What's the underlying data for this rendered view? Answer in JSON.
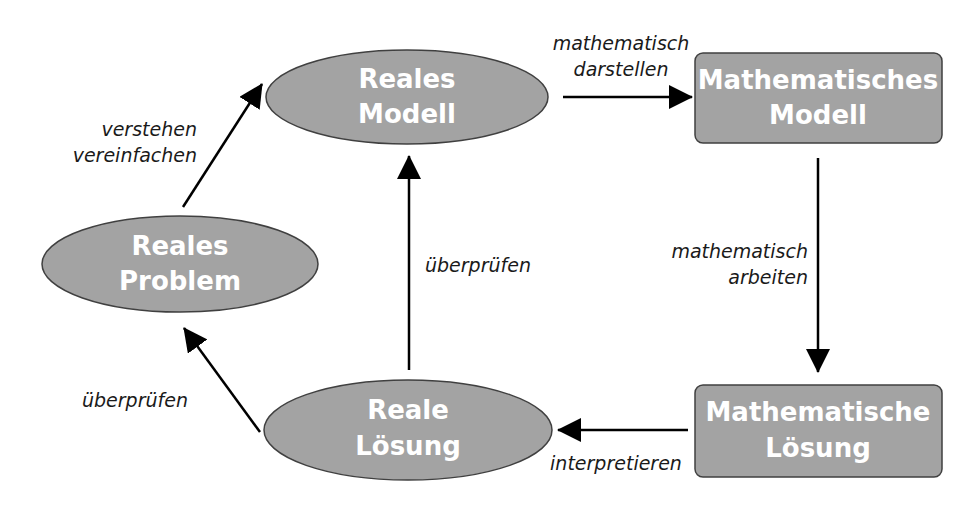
{
  "diagram": {
    "colors": {
      "node_fill": "#a3a3a3",
      "node_stroke": "#404040",
      "text_node": "#ffffff",
      "arrow": "#000000",
      "label": "#1a1a1a",
      "background": "#ffffff"
    },
    "nodes": {
      "reales_modell": {
        "shape": "ellipse",
        "line1": "Reales",
        "line2": "Modell"
      },
      "mathematisches_modell": {
        "shape": "rounded-rect",
        "line1": "Mathematisches",
        "line2": "Modell"
      },
      "reales_problem": {
        "shape": "ellipse",
        "line1": "Reales",
        "line2": "Problem"
      },
      "reale_loesung": {
        "shape": "ellipse",
        "line1": "Reale",
        "line2": "Lösung"
      },
      "mathematische_loesung": {
        "shape": "rounded-rect",
        "line1": "Mathematische",
        "line2": "Lösung"
      }
    },
    "edges": {
      "problem_to_reales_modell": {
        "from": "Reales Problem",
        "to": "Reales Modell",
        "line1": "verstehen",
        "line2": "vereinfachen"
      },
      "reales_modell_to_math_modell": {
        "from": "Reales Modell",
        "to": "Mathematisches Modell",
        "line1": "mathematisch",
        "line2": "darstellen"
      },
      "math_modell_to_math_loesung": {
        "from": "Mathematisches Modell",
        "to": "Mathematische Lösung",
        "line1": "mathematisch",
        "line2": "arbeiten"
      },
      "math_loesung_to_reale_loesung": {
        "from": "Mathematische Lösung",
        "to": "Reale Lösung",
        "label": "interpretieren"
      },
      "reale_loesung_to_reales_modell": {
        "from": "Reale Lösung",
        "to": "Reales Modell",
        "label": "überprüfen"
      },
      "reale_loesung_to_problem": {
        "from": "Reale Lösung",
        "to": "Reales Problem",
        "label": "überprüfen"
      }
    }
  }
}
